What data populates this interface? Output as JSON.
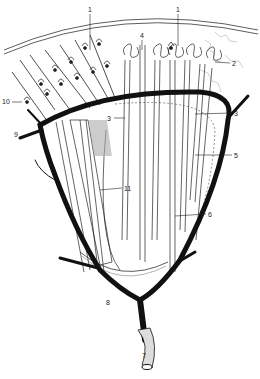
{
  "diagram": {
    "type": "anatomical-illustration",
    "colors": {
      "ink": "#111111",
      "background": "#ffffff",
      "stipple": "#555555"
    },
    "labels": [
      {
        "id": "1a",
        "text": "1",
        "x": 88,
        "y": 12
      },
      {
        "id": "1b",
        "text": "1",
        "x": 176,
        "y": 12
      },
      {
        "id": "2",
        "text": "2",
        "x": 232,
        "y": 64
      },
      {
        "id": "3a",
        "text": "3",
        "x": 116,
        "y": 120
      },
      {
        "id": "3b",
        "text": "3",
        "x": 234,
        "y": 115
      },
      {
        "id": "4",
        "text": "4",
        "x": 140,
        "y": 38
      },
      {
        "id": "5",
        "text": "5",
        "x": 234,
        "y": 157
      },
      {
        "id": "6",
        "text": "6",
        "x": 208,
        "y": 216
      },
      {
        "id": "7",
        "text": "7",
        "x": 142,
        "y": 358
      },
      {
        "id": "8",
        "text": "8",
        "x": 108,
        "y": 304
      },
      {
        "id": "9",
        "text": "9",
        "x": 18,
        "y": 136
      },
      {
        "id": "10",
        "text": "10",
        "x": 4,
        "y": 104
      },
      {
        "id": "11",
        "text": "11",
        "x": 124,
        "y": 190
      }
    ]
  }
}
